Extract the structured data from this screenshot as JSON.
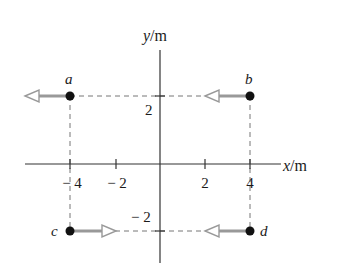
{
  "figure": {
    "type": "coordinate-diagram",
    "axes": {
      "x_label_var": "x",
      "x_label_unit": "/m",
      "y_label_var": "y",
      "y_label_unit": "/m",
      "x_ticks": [
        "− 4",
        "− 2",
        "2",
        "4"
      ],
      "y_ticks": [
        "2",
        "− 2"
      ]
    },
    "points": [
      {
        "label": "a",
        "x": -4,
        "y": 2,
        "arrow": "left"
      },
      {
        "label": "b",
        "x": 4,
        "y": 2,
        "arrow": "left"
      },
      {
        "label": "c",
        "x": -4,
        "y": -2,
        "arrow": "right"
      },
      {
        "label": "d",
        "x": 4,
        "y": -2,
        "arrow": "left"
      }
    ],
    "colors": {
      "axis": "#333333",
      "dash": "#777777",
      "arrow": "#999999",
      "point": "#111111"
    }
  }
}
